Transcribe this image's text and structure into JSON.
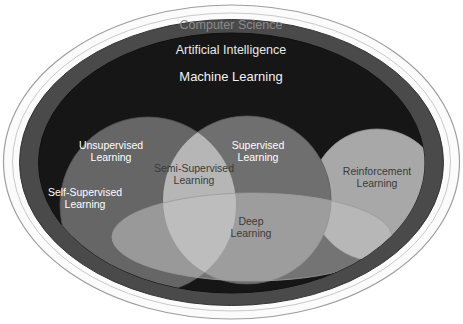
{
  "diagram": {
    "type": "venn-euler",
    "background_color": "#ffffff",
    "nested_levels": [
      {
        "id": "computer-science",
        "label": "Computer Science",
        "shape": "ellipse",
        "fill": "#fbfbfb",
        "stroke": "#9a9a9a",
        "text_color": "#8a8a8a"
      },
      {
        "id": "artificial-intelligence",
        "label": "Artificial Intelligence",
        "shape": "ellipse",
        "fill": "#4a4a4a",
        "stroke": "#2e2e2e",
        "text_color": "#e9e9e9"
      },
      {
        "id": "machine-learning",
        "label": "Machine Learning",
        "shape": "ellipse",
        "fill": "#161616",
        "stroke": "#0d0d0d",
        "text_color": "#f2f2f2"
      }
    ],
    "sets": [
      {
        "id": "unsupervised-learning",
        "label": "Unsupervised\nLearning",
        "shape": "circle",
        "fill": "#666666",
        "text_color": "#ffffff",
        "parent": "machine-learning"
      },
      {
        "id": "self-supervised-learning",
        "label": "Self-Supervised\nLearning",
        "shape": "region",
        "region_of": "unsupervised-learning",
        "fill": "#666666",
        "text_color": "#ffffff",
        "parent": "machine-learning"
      },
      {
        "id": "supervised-learning",
        "label": "Supervised\nLearning",
        "shape": "circle",
        "fill": "#6a6a6a",
        "text_color": "#ffffff",
        "parent": "machine-learning"
      },
      {
        "id": "semi-supervised-learning",
        "label": "Semi-Supervised\nLearning",
        "shape": "intersection",
        "intersection_of": [
          "unsupervised-learning",
          "supervised-learning"
        ],
        "fill": "#b4b4b4",
        "text_color": "#3a3a3a",
        "parent": "machine-learning"
      },
      {
        "id": "reinforcement-learning",
        "label": "Reinforcement\nLearning",
        "shape": "circle",
        "fill": "#a8a8a8",
        "text_color": "#3a3a3a",
        "parent": "machine-learning"
      },
      {
        "id": "deep-learning",
        "label": "Deep\nLearning",
        "shape": "ellipse",
        "fill": "#b0b0b0",
        "opacity": 0.62,
        "text_color": "#3a3a3a",
        "parent": "machine-learning",
        "overlaps": [
          "unsupervised-learning",
          "supervised-learning",
          "semi-supervised-learning",
          "reinforcement-learning",
          "self-supervised-learning"
        ]
      }
    ]
  }
}
